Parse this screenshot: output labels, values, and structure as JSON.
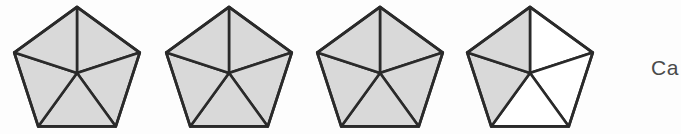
{
  "figure": {
    "background_color": "#fdfdfd",
    "shaded_fill": "#d9d9d9",
    "unshaded_fill": "#ffffff",
    "stroke_color": "#2a2a2a",
    "stroke_width": 2.6,
    "pentagon_count": 4,
    "sectors_per_pentagon": 5,
    "pentagons": [
      {
        "id": "pentagon-1",
        "label": "Pentagon 1",
        "center_x": 77,
        "center_y": 73,
        "radius": 66,
        "shaded_sectors": [
          0,
          1,
          2,
          3,
          4
        ],
        "shaded_count": 5,
        "fraction": "5/5"
      },
      {
        "id": "pentagon-2",
        "label": "Pentagon 2",
        "center_x": 229,
        "center_y": 73,
        "radius": 66,
        "shaded_sectors": [
          0,
          1,
          2,
          3,
          4
        ],
        "shaded_count": 5,
        "fraction": "5/5"
      },
      {
        "id": "pentagon-3",
        "label": "Pentagon 3",
        "center_x": 380,
        "center_y": 73,
        "radius": 66,
        "shaded_sectors": [
          0,
          1,
          2,
          3,
          4
        ],
        "shaded_count": 5,
        "fraction": "5/5"
      },
      {
        "id": "pentagon-4",
        "label": "Pentagon 4",
        "center_x": 530,
        "center_y": 73,
        "radius": 66,
        "shaded_sectors": [
          3,
          4
        ],
        "shaded_count": 2,
        "fraction": "2/5"
      }
    ],
    "total_shaded": 17,
    "total_sectors": 20
  },
  "caption": {
    "text": "Ca",
    "note": "text truncated at right edge of image"
  }
}
